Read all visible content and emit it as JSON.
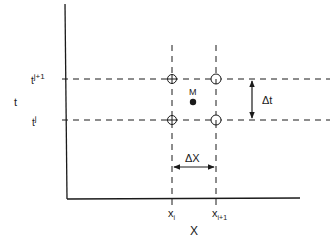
{
  "diagram": {
    "type": "finite-difference-grid",
    "colors": {
      "ink": "#1a1a1a",
      "background": "#ffffff"
    },
    "axes": {
      "y_label": "t",
      "x_label": "X"
    },
    "time_levels": [
      {
        "label_base": "t",
        "label_sup": "j+1"
      },
      {
        "label_base": "t",
        "label_sup": "j"
      }
    ],
    "space_levels": [
      {
        "label_base": "x",
        "label_sub": "i"
      },
      {
        "label_base": "x",
        "label_sub": "i+1"
      }
    ],
    "nodes": [
      {
        "name": "node-i-j+1",
        "style": "circle-cross"
      },
      {
        "name": "node-i+1-j+1",
        "style": "circle-half"
      },
      {
        "name": "node-i-j",
        "style": "circle-cross"
      },
      {
        "name": "node-i+1-j",
        "style": "circle-half"
      }
    ],
    "midpoint": {
      "label": "M"
    },
    "delta_t": {
      "label": "Δt"
    },
    "delta_x": {
      "label": "ΔX"
    }
  }
}
